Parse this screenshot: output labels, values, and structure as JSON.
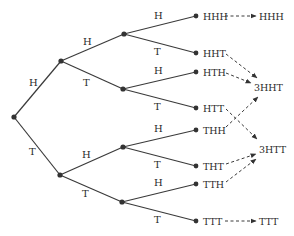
{
  "diagram": {
    "type": "probability-tree",
    "root": "start",
    "level1": [
      {
        "label": "H",
        "branch": "H"
      },
      {
        "label": "T",
        "branch": "T"
      }
    ],
    "level2": [
      {
        "path": "HH",
        "label": "H"
      },
      {
        "path": "HT",
        "label": "T"
      },
      {
        "path": "TH",
        "label": "H"
      },
      {
        "path": "TT",
        "label": "T"
      }
    ],
    "level3_branch_labels": [
      "H",
      "T",
      "H",
      "T",
      "H",
      "T",
      "H",
      "T"
    ],
    "outcomes": [
      "HHH",
      "HHT",
      "HTH",
      "HTT",
      "THH",
      "THT",
      "TTH",
      "TTT"
    ],
    "groups": [
      {
        "label": "HHH",
        "from": [
          "HHH"
        ]
      },
      {
        "label": "3HHT",
        "from": [
          "HHT",
          "HTH",
          "THH"
        ]
      },
      {
        "label": "3HTT",
        "from": [
          "HTT",
          "THT",
          "TTH"
        ]
      },
      {
        "label": "TTT",
        "from": [
          "TTT"
        ]
      }
    ]
  }
}
